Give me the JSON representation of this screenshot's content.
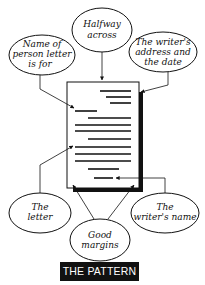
{
  "diagram": {
    "title": "THE PATTERN",
    "callouts": [
      {
        "id": "halfway",
        "lines": [
          "Halfway",
          "across"
        ]
      },
      {
        "id": "recipient",
        "lines": [
          "Name of",
          "person letter",
          "is for"
        ]
      },
      {
        "id": "address",
        "lines": [
          "The writer's",
          "address and",
          "the date"
        ]
      },
      {
        "id": "letter",
        "lines": [
          "The",
          "letter"
        ]
      },
      {
        "id": "name",
        "lines": [
          "The",
          "writer's name"
        ]
      },
      {
        "id": "margins",
        "lines": [
          "Good",
          "margins"
        ]
      }
    ],
    "colors": {
      "ink": "#111111",
      "background": "#ffffff",
      "title_bg": "#111111",
      "title_text": "#ffffff"
    }
  }
}
